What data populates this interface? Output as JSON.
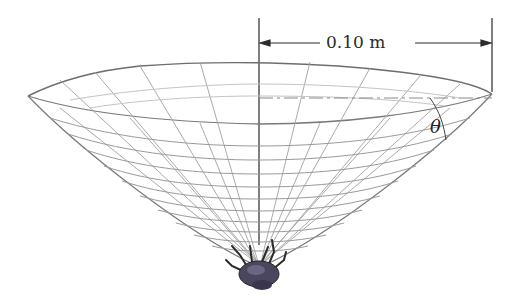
{
  "figure": {
    "dimension": {
      "label": "0.10 m",
      "value": 0.1,
      "unit": "m"
    },
    "angle_label": "θ"
  },
  "colors": {
    "web": "#9a9a9a",
    "rim": "#6e6e6e",
    "axis": "#2b2b2b",
    "dash": "#8a8a8a",
    "spider": "#4a4660"
  }
}
